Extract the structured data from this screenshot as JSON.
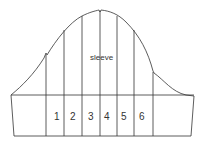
{
  "diagram": {
    "title_label": "sleeve",
    "sections": [
      "1",
      "2",
      "3",
      "4",
      "5",
      "6"
    ],
    "line_color": "#333333"
  }
}
